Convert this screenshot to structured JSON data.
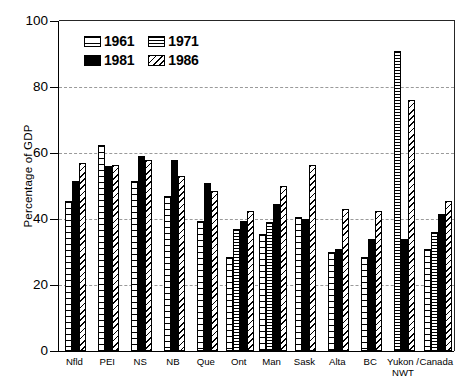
{
  "chart_data": {
    "type": "bar",
    "title": "",
    "xlabel": "",
    "ylabel": "Percentage of GDP",
    "ylim": [
      0,
      100
    ],
    "yticks": [
      0,
      20,
      40,
      60,
      80,
      100
    ],
    "grid": "horizontal-dashed",
    "legend_position": "top-left-inside",
    "categories": [
      "Nfld",
      "PEI",
      "NS",
      "NB",
      "Que",
      "Ont",
      "Man",
      "Sask",
      "Alta",
      "BC",
      "Yukon / NWT",
      "Canada"
    ],
    "category_lines": [
      [
        "Nfld"
      ],
      [
        "PEI"
      ],
      [
        "NS"
      ],
      [
        "NB"
      ],
      [
        "Que"
      ],
      [
        "Ont"
      ],
      [
        "Man"
      ],
      [
        "Sask"
      ],
      [
        "Alta"
      ],
      [
        "BC"
      ],
      [
        "Yukon /",
        "NWT"
      ],
      [
        "Canada"
      ]
    ],
    "series": [
      {
        "name": "1961",
        "pattern": "horizontal-stripes-sparse",
        "values": [
          45.5,
          62.5,
          51.5,
          47.0,
          39.5,
          28.5,
          35.5,
          40.5,
          30.0,
          28.5,
          0.0,
          31.0
        ]
      },
      {
        "name": "1971",
        "pattern": "horizontal-stripes-dense",
        "values": [
          0.0,
          0.0,
          0.0,
          0.0,
          0.0,
          37.0,
          39.0,
          0.0,
          0.0,
          0.0,
          91.0,
          36.0
        ]
      },
      {
        "name": "1981",
        "pattern": "solid-black",
        "values": [
          51.5,
          56.0,
          59.0,
          58.0,
          51.0,
          39.5,
          44.5,
          40.0,
          31.0,
          34.0,
          34.0,
          41.5
        ]
      },
      {
        "name": "1986",
        "pattern": "diagonal-hatch",
        "values": [
          57.0,
          56.5,
          58.0,
          53.0,
          48.5,
          42.5,
          50.0,
          56.5,
          43.0,
          42.5,
          76.0,
          45.5
        ]
      }
    ]
  },
  "legend": {
    "items": [
      {
        "label": "1961"
      },
      {
        "label": "1971"
      },
      {
        "label": "1981"
      },
      {
        "label": "1986"
      }
    ]
  }
}
